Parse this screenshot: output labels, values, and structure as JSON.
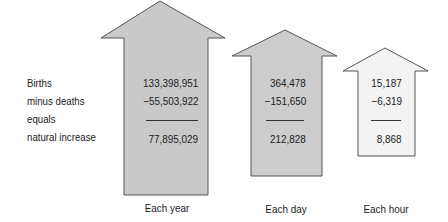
{
  "row_labels": {
    "births": "Births",
    "deaths": "minus deaths",
    "equals": "equals",
    "natural_increase": "natural increase"
  },
  "columns": [
    {
      "caption": "Each year",
      "births": "133,398,951",
      "deaths": "−55,503,922",
      "natural_increase": "77,895,029",
      "fill": "#c9c9c9"
    },
    {
      "caption": "Each day",
      "births": "364,478",
      "deaths": "−151,650",
      "natural_increase": "212,828",
      "fill": "#cdcdcd"
    },
    {
      "caption": "Each hour",
      "births": "15,187",
      "deaths": "−6,319",
      "natural_increase": "8,868",
      "fill": "#f3f3f3"
    }
  ],
  "colors": {
    "stroke": "#555555",
    "text": "#222222"
  }
}
